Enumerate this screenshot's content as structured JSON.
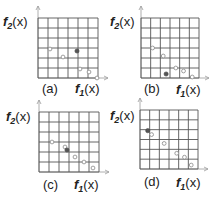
{
  "chart_data": [
    {
      "type": "scatter",
      "panel": "a",
      "caption": "(a)",
      "xlabel": "f1(x)",
      "ylabel": "f2(x)",
      "grid": {
        "cols": 6,
        "rows": 6,
        "on": true
      },
      "hollow_points": [
        [
          1.2,
          3.1
        ],
        [
          2.5,
          3.9
        ],
        [
          4.2,
          5.1
        ],
        [
          5.1,
          5.4
        ],
        [
          5.9,
          6.0
        ]
      ],
      "filled_points": [
        [
          3.9,
          3.3
        ]
      ]
    },
    {
      "type": "scatter",
      "panel": "b",
      "caption": "(b)",
      "xlabel": "f1(x)",
      "ylabel": "f2(x)",
      "grid": {
        "cols": 6,
        "rows": 6,
        "on": true
      },
      "hollow_points": [
        [
          1.2,
          3.0
        ],
        [
          2.3,
          3.8
        ],
        [
          3.6,
          5.0
        ],
        [
          4.4,
          5.3
        ],
        [
          5.3,
          5.9
        ]
      ],
      "filled_points": [
        [
          2.6,
          5.6
        ]
      ]
    },
    {
      "type": "scatter",
      "panel": "c",
      "caption": "(c)",
      "xlabel": "f1(x)",
      "ylabel": "f2(x)",
      "grid": {
        "cols": 6,
        "rows": 6,
        "on": true
      },
      "hollow_points": [
        [
          1.3,
          3.0
        ],
        [
          2.6,
          3.5
        ],
        [
          3.6,
          4.5
        ],
        [
          4.5,
          5.0
        ],
        [
          5.4,
          5.6
        ]
      ],
      "filled_points": [
        [
          2.8,
          3.8
        ]
      ]
    },
    {
      "type": "scatter",
      "panel": "d",
      "caption": "(d)",
      "xlabel": "f1(x)",
      "ylabel": "f2(x)",
      "grid": {
        "cols": 6,
        "rows": 6,
        "on": true
      },
      "hollow_points": [
        [
          1.2,
          2.5
        ],
        [
          2.5,
          3.4
        ],
        [
          3.8,
          4.4
        ],
        [
          4.6,
          4.8
        ],
        [
          5.3,
          5.6
        ]
      ],
      "filled_points": [
        [
          0.8,
          2.1
        ]
      ]
    }
  ],
  "labels": {
    "f2": "f",
    "f2_sub": "2",
    "f1": "f",
    "f1_sub": "1",
    "arg": "(x)",
    "captions": [
      "(a)",
      "(b)",
      "(c)",
      "(d)"
    ]
  },
  "colors": {
    "grid": "#555555",
    "axis": "#9a9a9a",
    "point_stroke": "#888888",
    "point_fill": "#555555",
    "text": "#222222"
  }
}
